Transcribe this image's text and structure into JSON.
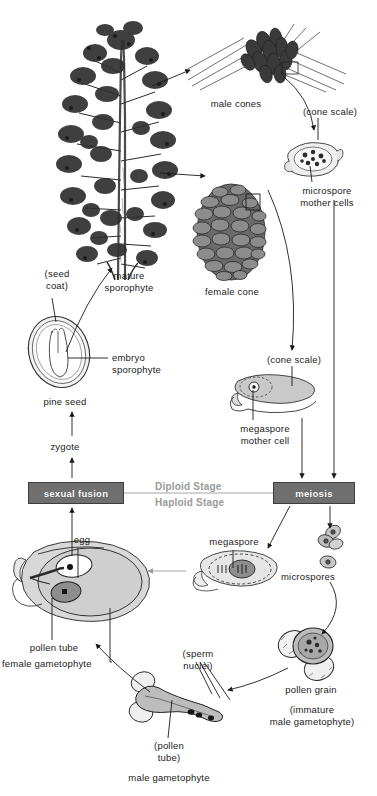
{
  "diagram": {
    "accent_box_color": "#6f6f6f",
    "stage_label_color": "#9a9a9a"
  },
  "stage_boxes": [
    {
      "id": "sexual-fusion",
      "label": "sexual fusion"
    },
    {
      "id": "meiosis",
      "label": "meiosis"
    }
  ],
  "stage_labels": {
    "diploid": "Diploid Stage",
    "haploid": "Haploid Stage"
  },
  "labels": [
    {
      "id": "male-cones",
      "text": "male cones"
    },
    {
      "id": "cone-scale-top",
      "text": "(cone scale)"
    },
    {
      "id": "microspore-mother",
      "text": "microspore\nmother cells"
    },
    {
      "id": "female-cone",
      "text": "female cone"
    },
    {
      "id": "mature-sporophyte",
      "text": "mature\nsporophyte"
    },
    {
      "id": "seed-coat",
      "text": "(seed\ncoat)"
    },
    {
      "id": "embryo-sporophyte",
      "text": "embryo\nsporophyte"
    },
    {
      "id": "pine-seed",
      "text": "pine seed"
    },
    {
      "id": "zygote",
      "text": "zygote"
    },
    {
      "id": "cone-scale-mid",
      "text": "(cone scale)"
    },
    {
      "id": "megaspore-mother",
      "text": "megaspore\nmother cell"
    },
    {
      "id": "egg",
      "text": "egg"
    },
    {
      "id": "megaspore",
      "text": "megaspore"
    },
    {
      "id": "microspores",
      "text": "microspores"
    },
    {
      "id": "pollen-tube-label",
      "text": "pollen tube"
    },
    {
      "id": "female-gametophyte",
      "text": "female gametophyte"
    },
    {
      "id": "sperm-nuclei",
      "text": "(sperm\nnuclei)"
    },
    {
      "id": "pollen-grain",
      "text": "pollen grain"
    },
    {
      "id": "immature-male-gam",
      "text": "(immature\nmale gametophyte)"
    },
    {
      "id": "pollen-tube-paren",
      "text": "(pollen\ntube)"
    },
    {
      "id": "male-gametophyte",
      "text": "male gametophyte"
    }
  ]
}
